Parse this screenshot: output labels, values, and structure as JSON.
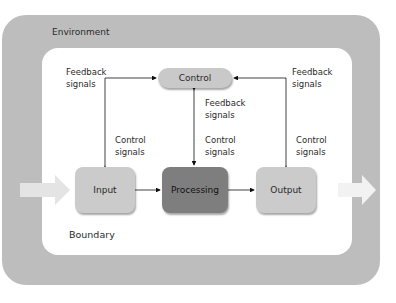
{
  "diagram": {
    "environment_label": "Environment",
    "boundary_label": "Boundary",
    "nodes": {
      "control": "Control",
      "input": "Input",
      "processing": "Processing",
      "output": "Output"
    },
    "labels": {
      "left_feedback": [
        "Feedback",
        "signals"
      ],
      "left_control": [
        "Control",
        "signals"
      ],
      "center_feedback": [
        "Feedback",
        "signals"
      ],
      "center_control": [
        "Control",
        "signals"
      ],
      "right_feedback": [
        "Feedback",
        "signals"
      ],
      "right_control": [
        "Control",
        "signals"
      ]
    },
    "edges": [
      {
        "from": "input",
        "to": "control",
        "label": "Feedback signals"
      },
      {
        "from": "control",
        "to": "input",
        "label": "Control signals"
      },
      {
        "from": "processing",
        "to": "control",
        "label": "Feedback signals"
      },
      {
        "from": "control",
        "to": "processing",
        "label": "Control signals"
      },
      {
        "from": "output",
        "to": "control",
        "label": "Feedback signals"
      },
      {
        "from": "control",
        "to": "output",
        "label": "Control signals"
      },
      {
        "from": "input",
        "to": "processing"
      },
      {
        "from": "processing",
        "to": "output"
      },
      {
        "from": "environment",
        "to": "input",
        "style": "wide-arrow"
      },
      {
        "from": "output",
        "to": "environment",
        "style": "wide-arrow"
      }
    ],
    "colors": {
      "environment": "#bdbdbd",
      "control": "#c9c9c9",
      "input": "#cbcbcb",
      "processing": "#7e7e7e",
      "output": "#cbcbcb"
    }
  }
}
